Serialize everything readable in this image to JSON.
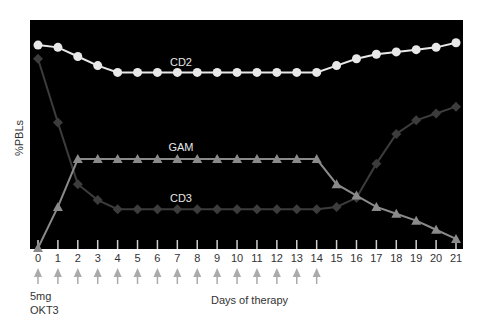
{
  "chart_data": {
    "type": "line",
    "title": "",
    "xlabel": "Days of therapy",
    "ylabel": "%PBLs",
    "x": [
      0,
      1,
      2,
      3,
      4,
      5,
      6,
      7,
      8,
      9,
      10,
      11,
      12,
      13,
      14,
      15,
      16,
      17,
      18,
      19,
      20,
      21
    ],
    "xticks": [
      "0",
      "1",
      "2",
      "3",
      "4",
      "5",
      "6",
      "7",
      "8",
      "9",
      "10",
      "11",
      "12",
      "13",
      "14",
      "15",
      "16",
      "17",
      "18",
      "19",
      "20",
      "21"
    ],
    "ylim": [
      0,
      100
    ],
    "y_ticks_shown": false,
    "grid": false,
    "background": "#000000",
    "series": [
      {
        "name": "CD2",
        "marker": "circle",
        "color": "#e8e8e8",
        "values": [
          89,
          88,
          84,
          80,
          77,
          77,
          77,
          77,
          77,
          77,
          77,
          77,
          77,
          77,
          77,
          80,
          83,
          85,
          86,
          87,
          88,
          90
        ]
      },
      {
        "name": "CD3",
        "marker": "diamond",
        "color": "#3c3c3c",
        "values": [
          83,
          55,
          28,
          21,
          17,
          17,
          17,
          17,
          17,
          17,
          17,
          17,
          17,
          17,
          17,
          18,
          22,
          37,
          50,
          56,
          59,
          62
        ]
      },
      {
        "name": "GAM",
        "marker": "triangle",
        "color": "#8a8a8a",
        "values": [
          0,
          18,
          39,
          39,
          39,
          39,
          39,
          39,
          39,
          39,
          39,
          39,
          39,
          39,
          39,
          28,
          23,
          18,
          15,
          12,
          8,
          4
        ]
      }
    ],
    "annotations": [
      {
        "text": "CD2",
        "x": 7,
        "series": "CD2"
      },
      {
        "text": "GAM",
        "x": 7,
        "series": "GAM"
      },
      {
        "text": "CD3",
        "x": 7,
        "series": "CD3"
      }
    ],
    "dose_arrows_days": [
      0,
      1,
      2,
      3,
      4,
      5,
      6,
      7,
      8,
      9,
      10,
      11,
      12,
      13,
      14
    ],
    "dose_label": [
      "5mg",
      "OKT3"
    ]
  }
}
